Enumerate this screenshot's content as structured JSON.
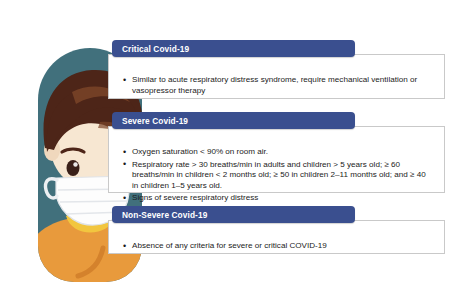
{
  "illustration": {
    "name": "masked-child-illustration",
    "description": "Illustration of a child wearing a white surgical face mask",
    "colors": {
      "background_teal": "#41707c",
      "hair_brown": "#4d2518",
      "hair_highlight": "#6b3a24",
      "skin": "#f7e7d2",
      "mask_white": "#fdfdfd",
      "mask_shadow": "#e3e6ea",
      "shirt_orange": "#e89a3c",
      "collar_yellow": "#f2c63f",
      "eye_dark": "#3a2018"
    }
  },
  "panels": [
    {
      "id": "critical",
      "header": "Critical Covid-19",
      "bullets": [
        "Similar to acute respiratory distress syndrome, require mechanical ventilation or vasopressor therapy"
      ]
    },
    {
      "id": "severe",
      "header": "Severe Covid-19",
      "bullets": [
        "Oxygen saturation < 90% on room air.",
        "Respiratory rate > 30 breaths/min in adults and children > 5 years old; ≥ 60 breaths/min in children < 2 months old; ≥ 50 in children 2–11 months old; and ≥ 40 in children 1–5 years old.",
        "Signs of severe respiratory distress"
      ]
    },
    {
      "id": "nonsevere",
      "header": "Non-Severe Covid-19",
      "bullets": [
        "Absence of any criteria for severe or critical COVID-19"
      ]
    }
  ],
  "theme": {
    "header_blue": "#3a4f8f",
    "box_border": "#c9c9c9",
    "text_color": "#1b1b1b",
    "page_background": "#ffffff"
  }
}
